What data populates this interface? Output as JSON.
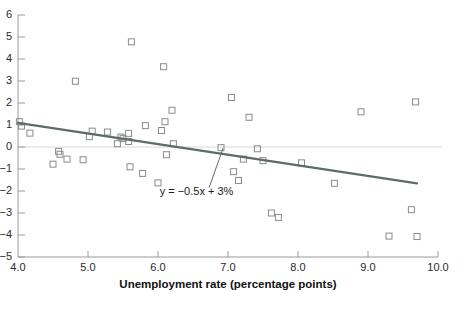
{
  "chart_data": {
    "type": "scatter",
    "title": "",
    "xlabel": "Unemployment rate (percentage points)",
    "ylabel": "",
    "xlim": [
      4.0,
      10.0
    ],
    "ylim": [
      -5,
      6
    ],
    "xticks": [
      4.0,
      5.0,
      6.0,
      7.0,
      8.0,
      9.0,
      10.0
    ],
    "xtick_labels": [
      "4.0",
      "5.0",
      "6.0",
      "7.0",
      "8.0",
      "9.0",
      "10.0"
    ],
    "yticks": [
      6,
      5,
      4,
      3,
      2,
      1,
      0,
      -1,
      -2,
      -3,
      -4,
      -5
    ],
    "ytick_labels": [
      "6",
      "5",
      "4",
      "3",
      "2",
      "1",
      "0",
      "-1",
      "-2",
      "-3",
      "-4",
      "-5"
    ],
    "grid": false,
    "zero_line": true,
    "legend": "none",
    "marker": "open-square",
    "marker_color": "#8b8b8b",
    "trendline": {
      "label": "y = −0.5x + 3%",
      "color": "#5f6a6a",
      "equation_slope": -0.5,
      "equation_intercept": 3,
      "x_start": 4.0,
      "y_start": 1.1,
      "x_end": 9.7,
      "y_end": -1.65,
      "annotation_x": 6.55,
      "annotation_y": -2.2,
      "leader_from_x": 6.93,
      "leader_from_y": -0.05,
      "leader_to_x": 6.73,
      "leader_to_y": -1.85
    },
    "points": [
      {
        "x": 4.02,
        "y": 1.15
      },
      {
        "x": 4.05,
        "y": 0.95
      },
      {
        "x": 4.17,
        "y": 0.63
      },
      {
        "x": 4.5,
        "y": -0.78
      },
      {
        "x": 4.58,
        "y": -0.2
      },
      {
        "x": 4.6,
        "y": -0.33
      },
      {
        "x": 4.7,
        "y": -0.55
      },
      {
        "x": 4.82,
        "y": 2.99
      },
      {
        "x": 4.93,
        "y": -0.58
      },
      {
        "x": 5.02,
        "y": 0.47
      },
      {
        "x": 5.06,
        "y": 0.72
      },
      {
        "x": 5.28,
        "y": 0.68
      },
      {
        "x": 5.42,
        "y": 0.15
      },
      {
        "x": 5.47,
        "y": 0.45
      },
      {
        "x": 5.5,
        "y": 0.38
      },
      {
        "x": 5.58,
        "y": 0.62
      },
      {
        "x": 5.58,
        "y": 0.25
      },
      {
        "x": 5.6,
        "y": -0.9
      },
      {
        "x": 5.62,
        "y": 4.78
      },
      {
        "x": 5.78,
        "y": -1.2
      },
      {
        "x": 5.82,
        "y": 0.97
      },
      {
        "x": 6.0,
        "y": -1.63
      },
      {
        "x": 6.05,
        "y": 0.75
      },
      {
        "x": 6.08,
        "y": 3.65
      },
      {
        "x": 6.1,
        "y": 1.15
      },
      {
        "x": 6.12,
        "y": -0.35
      },
      {
        "x": 6.2,
        "y": 1.67
      },
      {
        "x": 6.22,
        "y": 0.15
      },
      {
        "x": 6.9,
        "y": -0.03
      },
      {
        "x": 7.05,
        "y": 2.25
      },
      {
        "x": 7.08,
        "y": -1.12
      },
      {
        "x": 7.15,
        "y": -1.52
      },
      {
        "x": 7.22,
        "y": -0.55
      },
      {
        "x": 7.3,
        "y": 1.35
      },
      {
        "x": 7.42,
        "y": -0.08
      },
      {
        "x": 7.5,
        "y": -0.62
      },
      {
        "x": 7.62,
        "y": -3.0
      },
      {
        "x": 7.72,
        "y": -3.2
      },
      {
        "x": 8.05,
        "y": -0.72
      },
      {
        "x": 8.52,
        "y": -1.65
      },
      {
        "x": 8.9,
        "y": 1.6
      },
      {
        "x": 9.3,
        "y": -4.05
      },
      {
        "x": 9.62,
        "y": -2.85
      },
      {
        "x": 9.68,
        "y": 2.05
      },
      {
        "x": 9.7,
        "y": -4.07
      }
    ]
  },
  "figure": {
    "background_color": "#ffffff",
    "axis_color": "#9a9a9a",
    "text_color": "#2b2b2b"
  }
}
